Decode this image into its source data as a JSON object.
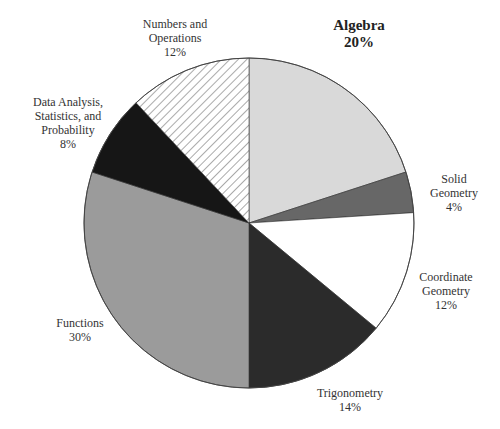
{
  "chart_data": {
    "type": "pie",
    "title": "",
    "start_angle_deg": 0,
    "direction": "clockwise",
    "slices": [
      {
        "name": "Algebra",
        "value": 20,
        "label": "Algebra",
        "pct": "20%",
        "color": "#d9d9d9",
        "pattern": "solid",
        "emphasis": true
      },
      {
        "name": "Solid Geometry",
        "value": 4,
        "label": "Solid Geometry",
        "pct": "4%",
        "color": "#676767",
        "pattern": "solid"
      },
      {
        "name": "Coordinate Geometry",
        "value": 12,
        "label": "Coordinate Geometry",
        "pct": "12%",
        "color": "#ffffff",
        "pattern": "solid"
      },
      {
        "name": "Trigonometry",
        "value": 14,
        "label": "Trigonometry",
        "pct": "14%",
        "color": "#2b2b2b",
        "pattern": "solid"
      },
      {
        "name": "Functions",
        "value": 30,
        "label": "Functions",
        "pct": "30%",
        "color": "#9b9b9b",
        "pattern": "solid"
      },
      {
        "name": "Data Analysis, Statistics, and Probability",
        "value": 8,
        "label": "Data Analysis, Statistics, and Probability",
        "pct": "8%",
        "color": "#161616",
        "pattern": "solid"
      },
      {
        "name": "Numbers and Operations",
        "value": 12,
        "label": "Numbers and Operations",
        "pct": "12%",
        "color": "#ffffff",
        "pattern": "diagonal-hatch"
      }
    ],
    "legend": "none (labels placed outside slices)"
  },
  "labels": {
    "algebra": {
      "line1": "Algebra",
      "line2": "20%"
    },
    "solid": {
      "line1": "Solid",
      "line2": "Geometry",
      "line3": "4%"
    },
    "coord": {
      "line1": "Coordinate",
      "line2": "Geometry",
      "line3": "12%"
    },
    "trig": {
      "line1": "Trigonometry",
      "line2": "14%"
    },
    "functions": {
      "line1": "Functions",
      "line2": "30%"
    },
    "data": {
      "line1": "Data Analysis,",
      "line2": "Statistics, and",
      "line3": "Probability",
      "line4": "8%"
    },
    "numbers": {
      "line1": "Numbers and",
      "line2": "Operations",
      "line3": "12%"
    }
  },
  "geometry": {
    "cx": 249,
    "cy": 223,
    "r": 165
  }
}
